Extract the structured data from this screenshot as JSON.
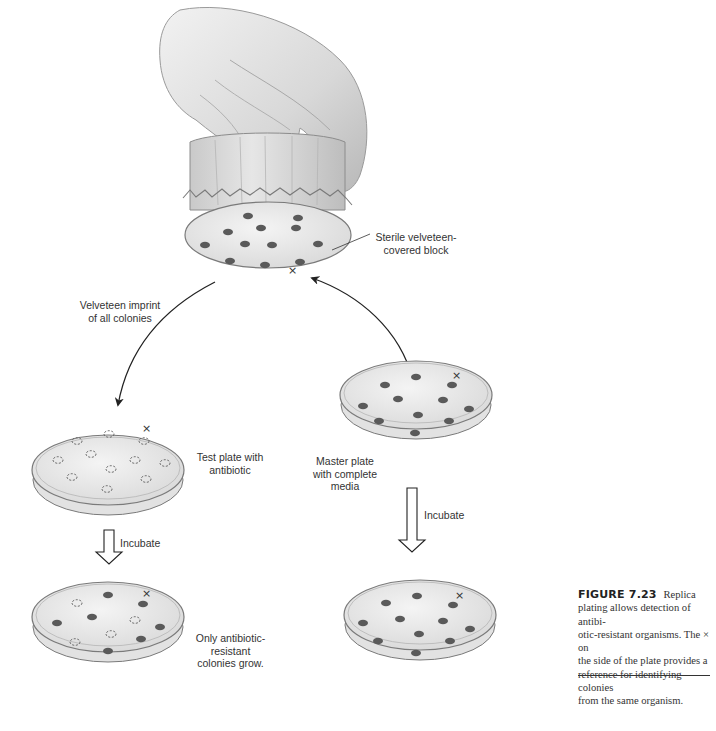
{
  "figure": {
    "number": "FIGURE 7.23",
    "title": "Replica",
    "caption_text": "plating allows detection of antibiotic-resistant organisms. The × on the side of the plate provides a reference for identifying colonies from the same organism.",
    "caption_lines": [
      "plating allows detection of antibi-",
      "otic-resistant organisms. The × on",
      "the side of the plate provides a",
      "reference for identifying colonies",
      "from the same organism."
    ]
  },
  "labels": {
    "block": "Sterile velveteen-\ncovered block",
    "imprint": "Velveteen imprint\nof all colonies",
    "test_plate": "Test plate with\nantibiotic",
    "master_plate": "Master plate\nwith complete\nmedia",
    "incubate_left": "Incubate",
    "incubate_right": "Incubate",
    "result": "Only antibiotic-\nresistant\ncolonies grow."
  },
  "plates": {
    "velveteen_block": {
      "colonies": 11,
      "type": "solid",
      "marker": "×"
    },
    "master_plate": {
      "colonies": 11,
      "type": "solid",
      "marker": "×"
    },
    "test_plate": {
      "colonies": 11,
      "type": "dashed-imprint",
      "marker": "×"
    },
    "test_plate_incubated": {
      "solid_colonies": 7,
      "dashed_colonies": 4,
      "marker": "×"
    },
    "master_plate_incubated": {
      "colonies": 11,
      "type": "solid",
      "marker": "×"
    }
  },
  "colors": {
    "colony": "#5a5a5a",
    "agar": "#e9e9e9",
    "plate_rim": "#8a8a8a",
    "line": "#2a2a2a"
  }
}
